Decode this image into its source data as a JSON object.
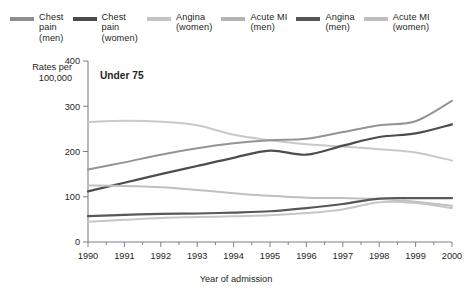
{
  "legend": {
    "items": [
      {
        "label": "Chest\npain\n(men)",
        "color": "#8e8e8e",
        "key": "chest-pain-men"
      },
      {
        "label": "Chest\npain\n(women)",
        "color": "#4a4a4a",
        "key": "chest-pain-women"
      },
      {
        "label": "Angina\n(women)",
        "color": "#c3c3c3",
        "key": "angina-women"
      },
      {
        "label": "Acute MI\n(men)",
        "color": "#b3b3b3",
        "key": "acute-mi-men"
      },
      {
        "label": "Angina\n(men)",
        "color": "#555555",
        "key": "angina-men"
      },
      {
        "label": "Acute MI\n(women)",
        "color": "#bdbdbd",
        "key": "acute-mi-women"
      }
    ]
  },
  "chart_data": {
    "type": "line",
    "title": "Under 75",
    "xlabel": "Year of admission",
    "ylabel": "Rates per\n100,000",
    "x": [
      1990,
      1991,
      1992,
      1993,
      1994,
      1995,
      1996,
      1997,
      1998,
      1999,
      2000
    ],
    "xtick_labels": [
      "1990",
      "1991",
      "1992",
      "1993",
      "1994",
      "1995",
      "1996",
      "1997",
      "1998",
      "1999",
      "2000"
    ],
    "ytick_labels": [
      "0",
      "100",
      "200",
      "300",
      "400"
    ],
    "yticks": [
      0,
      100,
      200,
      300,
      400
    ],
    "ylim": [
      0,
      400
    ],
    "xlim": [
      1990,
      2000
    ],
    "grid": false,
    "legend_position": "top",
    "series": [
      {
        "name": "Chest pain (women)",
        "color": "#c9c9c9",
        "width": 2.0,
        "values": [
          265,
          268,
          266,
          258,
          237,
          225,
          216,
          211,
          205,
          198,
          180
        ]
      },
      {
        "name": "Chest pain (men)",
        "color": "#949494",
        "width": 2.0,
        "values": [
          160,
          176,
          193,
          207,
          218,
          225,
          228,
          243,
          258,
          267,
          312
        ]
      },
      {
        "name": "Angina (men)",
        "color": "#4d4d4d",
        "width": 2.2,
        "values": [
          112,
          131,
          150,
          168,
          186,
          202,
          193,
          213,
          232,
          240,
          260
        ]
      },
      {
        "name": "Angina (women)",
        "color": "#c0c0c0",
        "width": 2.0,
        "values": [
          125,
          124,
          121,
          115,
          108,
          102,
          98,
          97,
          95,
          89,
          80
        ]
      },
      {
        "name": "Acute MI (men)",
        "color": "#585858",
        "width": 2.2,
        "values": [
          57,
          60,
          62,
          63,
          65,
          68,
          75,
          84,
          96,
          97,
          97
        ]
      },
      {
        "name": "Acute MI (women)",
        "color": "#c6c6c6",
        "width": 2.0,
        "values": [
          45,
          49,
          53,
          55,
          57,
          59,
          64,
          72,
          88,
          86,
          75
        ]
      }
    ]
  }
}
